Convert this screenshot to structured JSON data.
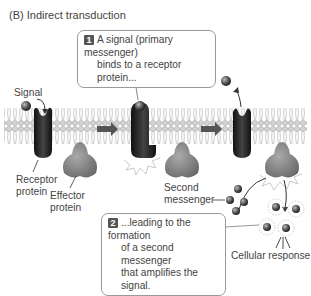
{
  "title": "(B) Indirect transduction",
  "callouts": [
    {
      "number": "1",
      "lines": [
        "A signal (primary messenger)",
        "binds to a receptor protein..."
      ]
    },
    {
      "number": "2",
      "lines": [
        "...leading to the formation",
        "of a second messenger",
        "that amplifies the signal."
      ]
    }
  ],
  "labels": {
    "signal": "Signal",
    "receptor": [
      "Receptor",
      "protein"
    ],
    "effector": [
      "Effector",
      "protein"
    ],
    "second_messenger": [
      "Second",
      "messenger"
    ],
    "cellular_response": "Cellular response"
  },
  "colors": {
    "membrane_head": "#c8c8c8",
    "receptor": "#2a2a2a",
    "effector": "#8a8a8a",
    "arrow": "#555555",
    "callout_border": "#9a9a9a"
  },
  "stages": 3
}
